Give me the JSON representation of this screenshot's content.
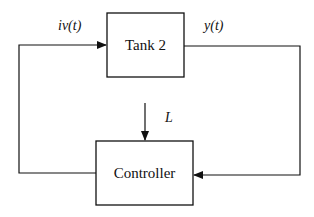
{
  "diagram": {
    "type": "feedback-control-block-diagram",
    "blocks": [
      {
        "id": "tank2",
        "label": "Tank 2"
      },
      {
        "id": "controller",
        "label": "Controller"
      }
    ],
    "signals": [
      {
        "id": "input",
        "label_main": "iv",
        "label_arg": "(t)",
        "from": "controller",
        "to": "tank2"
      },
      {
        "id": "output",
        "label_main": "y",
        "label_arg": "(t)",
        "from": "tank2",
        "to": "controller"
      },
      {
        "id": "level",
        "label_main": "L",
        "to": "controller"
      }
    ],
    "colors": {
      "line": "#111111",
      "background": "#ffffff"
    }
  }
}
